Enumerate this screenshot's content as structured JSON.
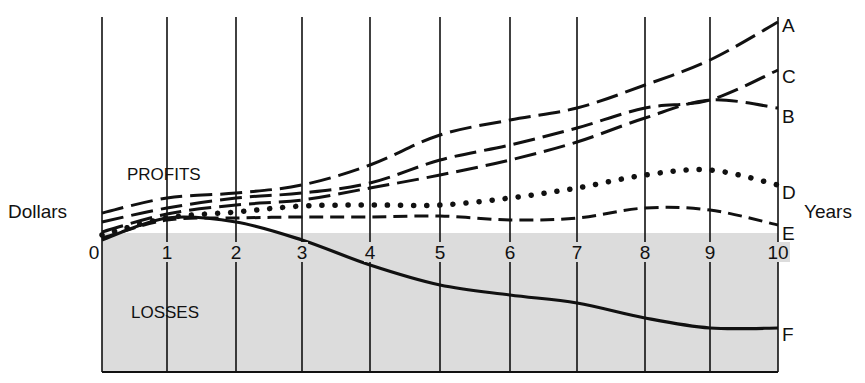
{
  "chart_data": {
    "type": "line",
    "title": "",
    "xlabel": "Years",
    "ylabel": "Dollars",
    "x": [
      0,
      1,
      2,
      3,
      4,
      5,
      6,
      7,
      8,
      9,
      10
    ],
    "xlim": [
      0,
      10
    ],
    "ylim": [
      -10,
      21
    ],
    "grid": {
      "vertical": true,
      "horizontal": false
    },
    "regions": [
      {
        "name": "PROFITS",
        "label": "PROFITS",
        "range": "above zero"
      },
      {
        "name": "LOSSES",
        "label": "LOSSES",
        "range": "below zero",
        "fill": "#dcdcdc"
      }
    ],
    "series": [
      {
        "name": "A",
        "style": "long-dash",
        "values": [
          2.0,
          3.5,
          4.0,
          4.8,
          6.8,
          9.8,
          11.3,
          12.5,
          14.8,
          17.3,
          21.1
        ]
      },
      {
        "name": "C",
        "style": "long-dash",
        "values": [
          1.1,
          2.5,
          3.5,
          4.0,
          5.0,
          7.3,
          8.8,
          10.5,
          12.5,
          13.3,
          16.3
        ]
      },
      {
        "name": "B",
        "style": "long-dash",
        "values": [
          0.1,
          1.9,
          2.8,
          3.3,
          4.5,
          5.8,
          7.3,
          9.1,
          11.5,
          13.3,
          12.5
        ]
      },
      {
        "name": "D",
        "style": "dotted",
        "values": [
          -0.2,
          1.5,
          2.1,
          2.7,
          2.8,
          2.8,
          3.5,
          4.5,
          5.8,
          6.3,
          4.8
        ]
      },
      {
        "name": "E",
        "style": "short-dash",
        "values": [
          -0.5,
          1.3,
          1.5,
          1.6,
          1.6,
          1.7,
          1.3,
          1.5,
          2.5,
          2.3,
          0.8
        ]
      },
      {
        "name": "F",
        "style": "solid",
        "values": [
          -0.7,
          1.5,
          1.1,
          -0.7,
          -3.2,
          -5.2,
          -6.2,
          -7.0,
          -8.5,
          -9.5,
          -9.5
        ]
      }
    ],
    "legend": "inline labels at right end of each curve (A–F)"
  },
  "labels": {
    "y_axis": "Dollars",
    "x_axis": "Years",
    "profits": "PROFITS",
    "losses": "LOSSES",
    "ticks": [
      "0",
      "1",
      "2",
      "3",
      "4",
      "5",
      "6",
      "7",
      "8",
      "9",
      "10"
    ],
    "series_names": [
      "A",
      "C",
      "B",
      "D",
      "E",
      "F"
    ]
  },
  "colors": {
    "ink": "#111111",
    "loss_fill": "#dcdcdc",
    "background": "#ffffff"
  }
}
